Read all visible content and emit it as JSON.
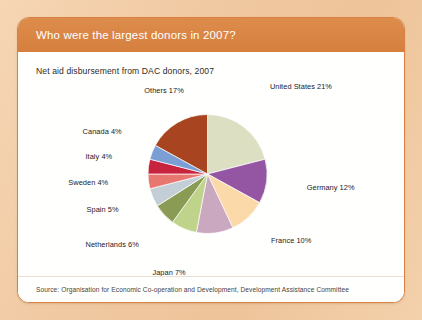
{
  "page": {
    "background_color": "#f2cda6"
  },
  "card": {
    "border_color": "#d98244",
    "header": {
      "title": "Who were the largest donors in 2007?",
      "background_color": "#d67f3e",
      "text_color": "#ffffff"
    },
    "footer": {
      "source": "Source: Organisation for Economic Co-operation and Development, Development Assistance Committee"
    }
  },
  "chart_data": {
    "type": "pie",
    "title": "Net aid disbursement from DAC donors, 2007",
    "subtitle": "",
    "xlabel": "",
    "ylabel": "",
    "legend_position": "none",
    "grid": false,
    "unit": "percent",
    "total": 100,
    "categories": [
      "United States",
      "Germany",
      "France",
      "United Kingdom",
      "Japan",
      "Netherlands",
      "Spain",
      "Sweden",
      "Italy",
      "Canada",
      "Others"
    ],
    "values": [
      21,
      12,
      10,
      10,
      7,
      6,
      5,
      4,
      4,
      4,
      17
    ],
    "colors": [
      "#dcdfc2",
      "#9455a3",
      "#fbd9a8",
      "#c9a8c0",
      "#bfd48a",
      "#8a9b54",
      "#c3ced6",
      "#e8776f",
      "#c8243f",
      "#7b9fd4",
      "#a84520"
    ],
    "labels": [
      "United States 21%",
      "Germany 12%",
      "France 10%",
      "United Kingdom 10%",
      "Japan 7%",
      "Netherlands 6%",
      "Spain 5%",
      "Sweden 4%",
      "Italy 4%",
      "Canada 4%",
      "Others 17%"
    ]
  }
}
